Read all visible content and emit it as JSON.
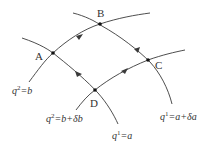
{
  "diagram": {
    "points": [
      {
        "id": "A",
        "label": "A"
      },
      {
        "id": "B",
        "label": "B"
      },
      {
        "id": "C",
        "label": "C"
      },
      {
        "id": "D",
        "label": "D"
      }
    ],
    "curves": [
      {
        "id": "q2_b",
        "var": "q",
        "sup": "2",
        "rhs": "=b",
        "label": "q2=b"
      },
      {
        "id": "q2_b_db",
        "var": "q",
        "sup": "2",
        "rhs": "=b+δb",
        "label": "q2=b+δb"
      },
      {
        "id": "q1_a",
        "var": "q",
        "sup": "1",
        "rhs": "=a",
        "label": "q1=a"
      },
      {
        "id": "q1_a_da",
        "var": "q",
        "sup": "1",
        "rhs": "=a+δa",
        "label": "q1=a+δa"
      }
    ],
    "loop_direction": [
      "A",
      "B",
      "C",
      "D",
      "A"
    ],
    "colors": {
      "line": "#3a3a3a",
      "dot": "#111111",
      "text": "#333333"
    }
  }
}
